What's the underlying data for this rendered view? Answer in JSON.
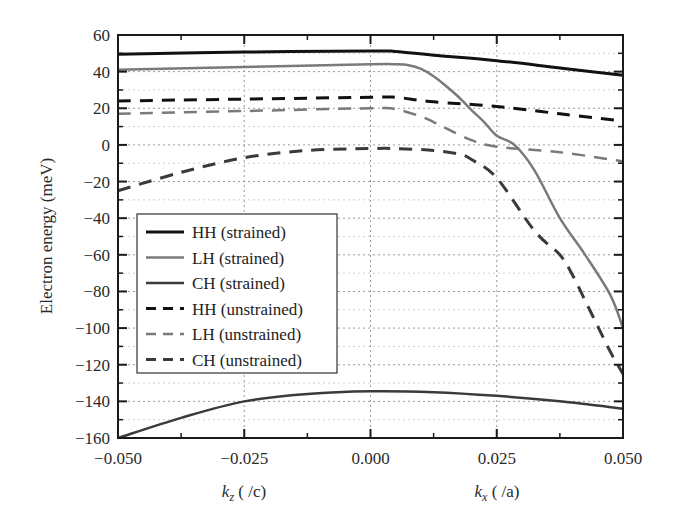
{
  "chart_data": {
    "type": "line",
    "title": "",
    "xlabel_left": "k_z ( /c)",
    "xlabel_right": "k_x ( /a)",
    "xlabel_left_parts": {
      "k": "k",
      "sub": "z",
      "unit": " ( /c)"
    },
    "xlabel_right_parts": {
      "k": "k",
      "sub": "x",
      "unit": " ( /a)"
    },
    "ylabel": "Electron energy (meV)",
    "xlim": [
      -0.05,
      0.05
    ],
    "ylim": [
      -160,
      60
    ],
    "xticks": [
      -0.05,
      -0.025,
      0.0,
      0.025,
      0.05
    ],
    "xtick_labels": [
      "−0.050",
      "−0.025",
      "0.000",
      "0.025",
      "0.050"
    ],
    "yticks": [
      60,
      40,
      20,
      0,
      -20,
      -40,
      -60,
      -80,
      -100,
      -120,
      -140,
      -160
    ],
    "ytick_labels": [
      "60",
      "40",
      "20",
      "0",
      "−20",
      "−40",
      "−60",
      "−80",
      "−100",
      "−120",
      "−140",
      "−160"
    ],
    "grid": true,
    "legend_position": "lower-left inside",
    "series": [
      {
        "name": "HH (strained)",
        "color": "#111111",
        "dash": "solid",
        "width": 3,
        "x": [
          -0.05,
          -0.025,
          0.0,
          0.005,
          0.0125,
          0.025,
          0.0375,
          0.05
        ],
        "y": [
          49.5,
          50.7,
          51.3,
          51,
          49,
          46,
          42,
          38
        ]
      },
      {
        "name": "LH (strained)",
        "color": "#7a7a7a",
        "dash": "solid",
        "width": 2.5,
        "x": [
          -0.05,
          -0.025,
          0.0,
          0.005,
          0.0075,
          0.01,
          0.0125,
          0.015,
          0.0175,
          0.02,
          0.0225,
          0.025,
          0.0285,
          0.0325,
          0.0375,
          0.0425,
          0.0475,
          0.05
        ],
        "y": [
          41,
          42.5,
          44,
          44,
          43.5,
          41.5,
          37.5,
          32,
          26,
          19,
          12.5,
          5,
          0,
          -14,
          -40,
          -60,
          -82,
          -100
        ]
      },
      {
        "name": "CH (strained)",
        "color": "#3a3a3a",
        "dash": "solid",
        "width": 2.5,
        "x": [
          -0.05,
          -0.0375,
          -0.025,
          -0.0125,
          0.0,
          0.0125,
          0.025,
          0.0375,
          0.05
        ],
        "y": [
          -160,
          -149,
          -140,
          -136,
          -134.5,
          -135,
          -137,
          -140,
          -144
        ]
      },
      {
        "name": "HH (unstrained)",
        "color": "#111111",
        "dash": "dashed",
        "width": 3,
        "x": [
          -0.05,
          -0.025,
          0.0,
          0.005,
          0.0125,
          0.025,
          0.0375,
          0.05
        ],
        "y": [
          24,
          25,
          26,
          26,
          23.5,
          21,
          17,
          13
        ]
      },
      {
        "name": "LH (unstrained)",
        "color": "#7a7a7a",
        "dash": "dashed",
        "width": 2.5,
        "x": [
          -0.05,
          -0.025,
          0.0,
          0.005,
          0.01,
          0.0125,
          0.015,
          0.02,
          0.025,
          0.0375,
          0.05
        ],
        "y": [
          17,
          18.5,
          20,
          19.5,
          15.5,
          12.5,
          9,
          2.6,
          -1,
          -4,
          -9
        ]
      },
      {
        "name": "CH (unstrained)",
        "color": "#3a3a3a",
        "dash": "dashed",
        "width": 3,
        "x": [
          -0.05,
          -0.0375,
          -0.025,
          -0.0125,
          0.0,
          0.005,
          0.0125,
          0.0175,
          0.02,
          0.025,
          0.0325,
          0.0375,
          0.04,
          0.0425,
          0.045,
          0.0475,
          0.05
        ],
        "y": [
          -25,
          -15,
          -7,
          -3,
          -2,
          -2,
          -3,
          -5,
          -8,
          -18,
          -47,
          -60,
          -71,
          -85,
          -99,
          -113,
          -125
        ]
      }
    ]
  }
}
